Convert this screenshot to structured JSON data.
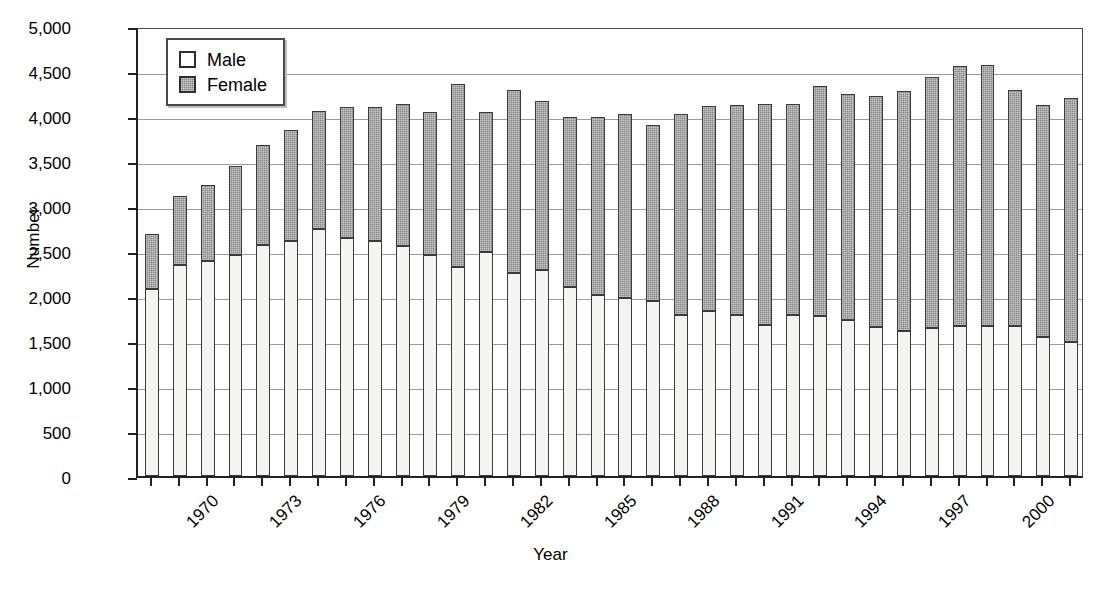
{
  "chart_data": {
    "type": "bar",
    "stacked": true,
    "title": "",
    "xlabel": "Year",
    "ylabel": "Number",
    "ylim": [
      0,
      5000
    ],
    "ytick_step": 500,
    "ytick_labels": [
      "0",
      "500",
      "1,000",
      "1,500",
      "2,000",
      "2,500",
      "3,000",
      "3,500",
      "4,000",
      "4,500",
      "5,000"
    ],
    "ytick_values": [
      0,
      500,
      1000,
      1500,
      2000,
      2500,
      3000,
      3500,
      4000,
      4500,
      5000
    ],
    "grid": true,
    "legend_position": "top-left-inside",
    "legend": [
      "Male",
      "Female"
    ],
    "categories": [
      "1970",
      "1971",
      "1972",
      "1973",
      "1974",
      "1975",
      "1976",
      "1977",
      "1978",
      "1979",
      "1980",
      "1981",
      "1982",
      "1983",
      "1984",
      "1985",
      "1986",
      "1987",
      "1988",
      "1989",
      "1990",
      "1991",
      "1992",
      "1993",
      "1994",
      "1995",
      "1996",
      "1997",
      "1998",
      "1999",
      "2000",
      "2001",
      "2002",
      "2003"
    ],
    "xtick_labels_shown": [
      "1970",
      "1973",
      "1976",
      "1979",
      "1982",
      "1985",
      "1988",
      "1991",
      "1994",
      "1997",
      "2000",
      "2003"
    ],
    "series": [
      {
        "name": "Male",
        "color": "#f4f4f2",
        "values": [
          2080,
          2340,
          2390,
          2460,
          2570,
          2610,
          2740,
          2650,
          2610,
          2560,
          2460,
          2320,
          2490,
          2260,
          2290,
          2100,
          2010,
          1980,
          1940,
          1790,
          1830,
          1790,
          1680,
          1790,
          1780,
          1730,
          1660,
          1610,
          1650,
          1670,
          1670,
          1670,
          1540,
          1490
        ]
      },
      {
        "name": "Female",
        "color": "#878787",
        "values": [
          610,
          770,
          840,
          990,
          1110,
          1240,
          1320,
          1450,
          1490,
          1570,
          1580,
          2040,
          1560,
          2030,
          1880,
          1890,
          1980,
          2040,
          1960,
          2230,
          2280,
          2330,
          2450,
          2340,
          2550,
          2510,
          2560,
          2670,
          2780,
          2890,
          2900,
          2620,
          2580,
          2710
        ]
      }
    ],
    "totals": [
      2690,
      3110,
      3230,
      3450,
      3680,
      3850,
      4060,
      4100,
      4100,
      4130,
      4040,
      4360,
      4050,
      4290,
      4170,
      3990,
      3990,
      4020,
      3900,
      4020,
      4110,
      4120,
      4130,
      4130,
      4330,
      4240,
      4220,
      4280,
      4430,
      4560,
      4570,
      4290,
      4120,
      4200
    ]
  }
}
